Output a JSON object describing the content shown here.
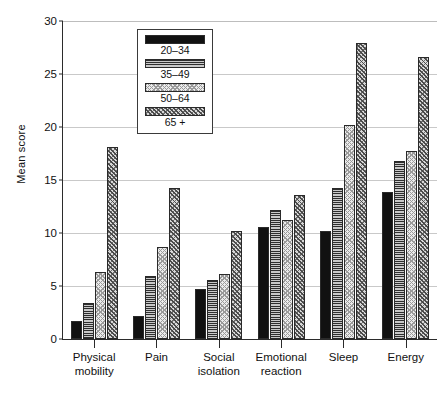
{
  "chart_data": {
    "type": "bar",
    "title": "",
    "xlabel": "",
    "ylabel": "Mean score",
    "ylim": [
      0,
      30
    ],
    "ytick_step": 5,
    "yticks": [
      0,
      5,
      10,
      15,
      20,
      25,
      30
    ],
    "grid": true,
    "legend_position": "inside-top-left",
    "categories": [
      "Physical mobility",
      "Pain",
      "Social isolation",
      "Emotional reaction",
      "Sleep",
      "Energy"
    ],
    "category_lines": [
      [
        "Physical",
        "mobility"
      ],
      [
        "Pain",
        ""
      ],
      [
        "Social",
        "isolation"
      ],
      [
        "Emotional",
        "reaction"
      ],
      [
        "Sleep",
        ""
      ],
      [
        "Energy",
        ""
      ]
    ],
    "series": [
      {
        "name": "20–34",
        "pattern": "solid-black",
        "values": [
          1.7,
          2.2,
          4.7,
          10.6,
          10.2,
          13.9
        ]
      },
      {
        "name": "35–49",
        "pattern": "horizontal-rule",
        "values": [
          3.4,
          5.9,
          5.6,
          12.2,
          14.2,
          16.8
        ]
      },
      {
        "name": "50–64",
        "pattern": "light-stipple",
        "values": [
          6.3,
          8.7,
          6.1,
          11.2,
          20.2,
          17.7
        ]
      },
      {
        "name": "65 +",
        "pattern": "diagonal-hatch",
        "values": [
          18.1,
          14.2,
          10.2,
          13.6,
          27.9,
          26.6
        ]
      }
    ]
  },
  "colors": {
    "axis": "#2b2b2b",
    "grid": "#c9c9c9",
    "text": "#111111",
    "series_20_34": "#111111",
    "series_35_49": "#8e8e8e",
    "series_50_64": "#ebebeb",
    "series_65_plus": "#d8d8d8",
    "background": "#ffffff"
  }
}
